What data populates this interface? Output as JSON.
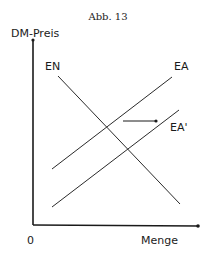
{
  "figure": {
    "caption": "Abb. 13",
    "y_axis_label": "DM-Preis",
    "x_axis_label": "Menge",
    "origin_label": "0"
  },
  "curves": [
    {
      "label": "EN",
      "description": "demand curve (downward sloping)"
    },
    {
      "label": "EA",
      "description": "supply curve (upward sloping)"
    },
    {
      "label": "EA'",
      "description": "shifted supply curve"
    }
  ],
  "annotations": {
    "shift_arrow": "arrow-right indicating rightward shift from EA to EA'"
  },
  "colors": {
    "ink": "#1a1a1a",
    "background": "#ffffff"
  }
}
